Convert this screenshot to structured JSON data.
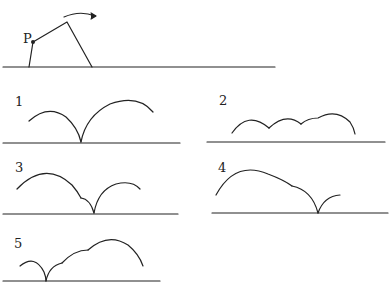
{
  "problem": {
    "header_text_cutoff": "",
    "point_label": "P",
    "motion_arrow": "clockwise-roll-arrow"
  },
  "options": [
    {
      "number": "1"
    },
    {
      "number": "2"
    },
    {
      "number": "3"
    },
    {
      "number": "4"
    },
    {
      "number": "5"
    }
  ],
  "colors": {
    "stroke": "#222222",
    "background": "#ffffff"
  }
}
